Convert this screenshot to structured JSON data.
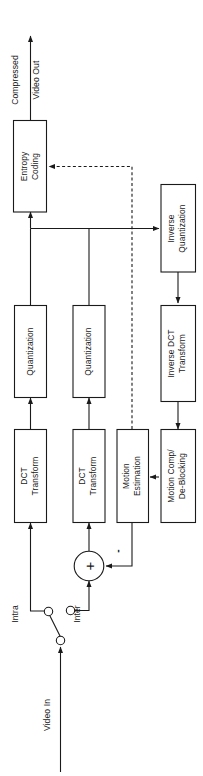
{
  "diagram": {
    "orientation": "rotated-90-ccw",
    "background_color": "#ffffff",
    "line_color": "#1a1a1a",
    "blocks": [
      {
        "id": "entropy_coding",
        "label_line1": "Entropy",
        "label_line2": "Coding"
      },
      {
        "id": "inverse_quantization",
        "label_line1": "Inverse",
        "label_line2": "Quantization"
      },
      {
        "id": "quantization_intra",
        "label_line1": "Quantization",
        "label_line2": ""
      },
      {
        "id": "quantization_inter",
        "label_line1": "Quantization",
        "label_line2": ""
      },
      {
        "id": "inverse_dct",
        "label_line1": "Inverse DCT",
        "label_line2": "Transform"
      },
      {
        "id": "dct_intra",
        "label_line1": "DCT",
        "label_line2": "Transform"
      },
      {
        "id": "dct_inter",
        "label_line1": "DCT",
        "label_line2": "Transform"
      },
      {
        "id": "motion_estimation",
        "label_line1": "Motion",
        "label_line2": "Estimation"
      },
      {
        "id": "motion_comp",
        "label_line1": "Motion Comp/",
        "label_line2": "De-Blocking"
      }
    ],
    "labels": {
      "compressed": "Compressed",
      "video_out": "Video Out",
      "video_in": "Video In",
      "intra": "Intra",
      "inter": "Inter",
      "plus": "+",
      "minus": "-"
    }
  }
}
